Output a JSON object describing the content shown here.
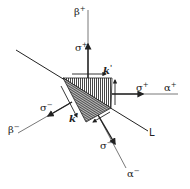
{
  "diagram": {
    "labels": {
      "beta_plus": "β",
      "beta_plus_sup": "+",
      "alpha_plus": "α",
      "alpha_plus_sup": "+",
      "beta_minus": "β",
      "beta_minus_sup": "−",
      "alpha_minus": "α",
      "alpha_minus_sup": "−",
      "sigma_plus_top": "σ",
      "sigma_plus_top_sup": "+",
      "sigma_plus_right": "σ",
      "sigma_plus_right_sup": "+",
      "sigma_minus_left": "σ",
      "sigma_minus_left_sup": "−",
      "sigma_minus_bottom": "σ",
      "sigma_minus_bottom_sup": "−",
      "k_top": "k",
      "k_top_sup": "'",
      "k_left": "k",
      "k_left_sup": "'",
      "line_L": "L"
    },
    "colors": {
      "ink": "#222222",
      "axis": "#555555"
    }
  }
}
